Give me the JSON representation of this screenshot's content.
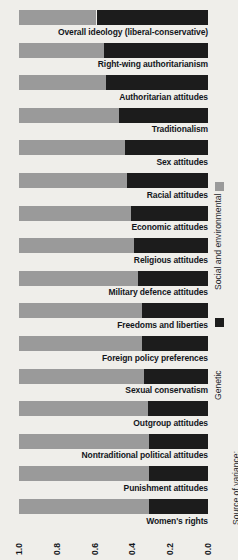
{
  "chart_data": {
    "type": "bar",
    "title": "",
    "subtitle": "",
    "orientation": "horizontal",
    "stacked": true,
    "xlabel": "Proportion of variance",
    "ylabel": "",
    "xlim": [
      1.0,
      0.0
    ],
    "x_axis_reversed": true,
    "grid": false,
    "tick_labels": [
      "1.0",
      "0.8",
      "0.6",
      "0.4",
      "0.2",
      "0.0"
    ],
    "tick_values": [
      1.0,
      0.8,
      0.6,
      0.4,
      0.2,
      0.0
    ],
    "legend_position": "right",
    "legend_title": "Source of variance:",
    "legend_entries": [
      {
        "name": "Social and environmental",
        "color": "#9a9a9a"
      },
      {
        "name": "Genetic",
        "color": "#1c1c1c"
      }
    ],
    "categories": [
      "Overall ideology (liberal-conservative)",
      "Right-wing authoritarianism",
      "Authoritarian attitudes",
      "Traditionalism",
      "Sex attitudes",
      "Racial attitudes",
      "Economic attitudes",
      "Religious attitudes",
      "Military defence attitudes",
      "Freedoms and liberties",
      "Foreign policy preferences",
      "Sexual conservatism",
      "Outgroup attitudes",
      "Nontraditional political attitudes",
      "Punishment attitudes",
      "Women's rights"
    ],
    "series": [
      {
        "name": "Social and environmental",
        "color": "#9a9a9a",
        "values": [
          0.41,
          0.45,
          0.46,
          0.53,
          0.56,
          0.57,
          0.59,
          0.61,
          0.63,
          0.65,
          0.65,
          0.66,
          0.68,
          0.69,
          0.69,
          0.69
        ]
      },
      {
        "name": "Genetic",
        "color": "#1c1c1c",
        "values": [
          0.59,
          0.55,
          0.54,
          0.47,
          0.44,
          0.43,
          0.41,
          0.39,
          0.37,
          0.35,
          0.35,
          0.34,
          0.32,
          0.31,
          0.31,
          0.31
        ]
      }
    ]
  }
}
